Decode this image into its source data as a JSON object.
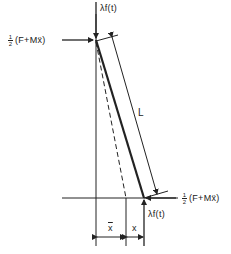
{
  "diagram": {
    "type": "inclined rod force diagram",
    "colors": {
      "line": "#222222",
      "background": "#ffffff"
    },
    "labels": {
      "top_vertical_force": "λf(t)",
      "bottom_vertical_force": "λf(t)",
      "top_horizontal_force": {
        "fraction_num": "1",
        "fraction_den": "2",
        "expr": "(F+Mẍ)"
      },
      "bottom_horizontal_force": {
        "fraction_num": "1",
        "fraction_den": "2",
        "expr": "(F+Mẍ)"
      },
      "length": "L",
      "x_bar": "x",
      "x": "x"
    }
  }
}
